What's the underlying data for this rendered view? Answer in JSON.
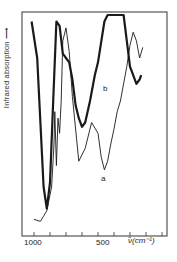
{
  "chart_data": {
    "type": "line",
    "title": "",
    "xlabel": "ν̃ (cm⁻¹)",
    "ylabel": "Infrared absorption →",
    "x_ticks": [
      1000,
      500
    ],
    "x_direction": "decreasing",
    "xlim": [
      1075,
      150
    ],
    "grid": false,
    "legend": "inline labels a, b",
    "series": [
      {
        "name": "a",
        "line": "thin",
        "x": [
          1000,
          960,
          920,
          890,
          875,
          870,
          860,
          850,
          840,
          830,
          820,
          800,
          780,
          760,
          720,
          680,
          640,
          600,
          580,
          560,
          540,
          520,
          500,
          480,
          460,
          440,
          420,
          400,
          380,
          360,
          340,
          320
        ],
        "y_rel": [
          0.05,
          0.04,
          0.09,
          0.2,
          0.4,
          0.55,
          0.3,
          0.52,
          0.45,
          0.6,
          0.88,
          0.94,
          0.83,
          0.62,
          0.32,
          0.38,
          0.5,
          0.45,
          0.34,
          0.28,
          0.32,
          0.4,
          0.47,
          0.55,
          0.6,
          0.68,
          0.76,
          0.86,
          0.92,
          0.88,
          0.8,
          0.85
        ]
      },
      {
        "name": "b",
        "line": "thick",
        "x": [
          1015,
          980,
          960,
          940,
          920,
          900,
          880,
          860,
          840,
          820,
          800,
          780,
          760,
          740,
          720,
          700,
          680,
          650,
          620,
          600,
          560,
          540,
          440,
          420,
          400,
          380,
          360,
          340,
          330
        ],
        "y_rel": [
          0.97,
          0.8,
          0.5,
          0.2,
          0.1,
          0.22,
          0.6,
          0.97,
          0.95,
          0.82,
          0.8,
          0.78,
          0.7,
          0.58,
          0.52,
          0.48,
          0.5,
          0.6,
          0.72,
          0.78,
          0.97,
          1.0,
          1.0,
          0.88,
          0.76,
          0.72,
          0.68,
          0.7,
          0.72
        ]
      }
    ],
    "annotations": [
      {
        "text": "a",
        "x": 610,
        "y_rel": 0.27
      },
      {
        "text": "b",
        "x": 620,
        "y_rel": 0.7
      }
    ]
  },
  "labels": {
    "ylabel": "Infrared absorption ⟶",
    "tick_1000": "1000",
    "tick_500": "500",
    "unit": "ν̃(cm⁻¹)",
    "curve_a": "a",
    "curve_b": "b"
  },
  "colors": {
    "line": "#1a1a1a",
    "frame": "#333333"
  }
}
